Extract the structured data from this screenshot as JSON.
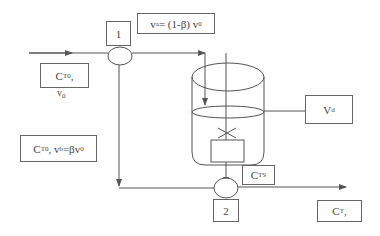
{
  "diagram": {
    "nodes": {
      "mixer_1": {
        "label": "1"
      },
      "mixer_2": {
        "label": "2"
      }
    },
    "labels": {
      "feed_main": "C",
      "feed_main_sub": "T0",
      "feed_main_suffix": ",",
      "feed_flow": "v",
      "feed_flow_sub": "0",
      "stream_a_v": "v",
      "stream_a_sub": "a",
      "stream_a_expr": "= (1-β) v",
      "stream_a_expr_sub": "0",
      "volume": "V",
      "volume_sub": "d",
      "bypass_c": "C",
      "bypass_c_sub": "T0",
      "bypass_mid": ", v",
      "bypass_v_sub": "b",
      "bypass_expr": "=βv",
      "bypass_expr_sub": "0",
      "tank_out": "C",
      "tank_out_sub": "TS",
      "outlet": "C",
      "outlet_sub": "T",
      "outlet_suffix": ","
    },
    "colors": {
      "line": "#555555",
      "text": "#444444",
      "background": "#ffffff"
    }
  }
}
